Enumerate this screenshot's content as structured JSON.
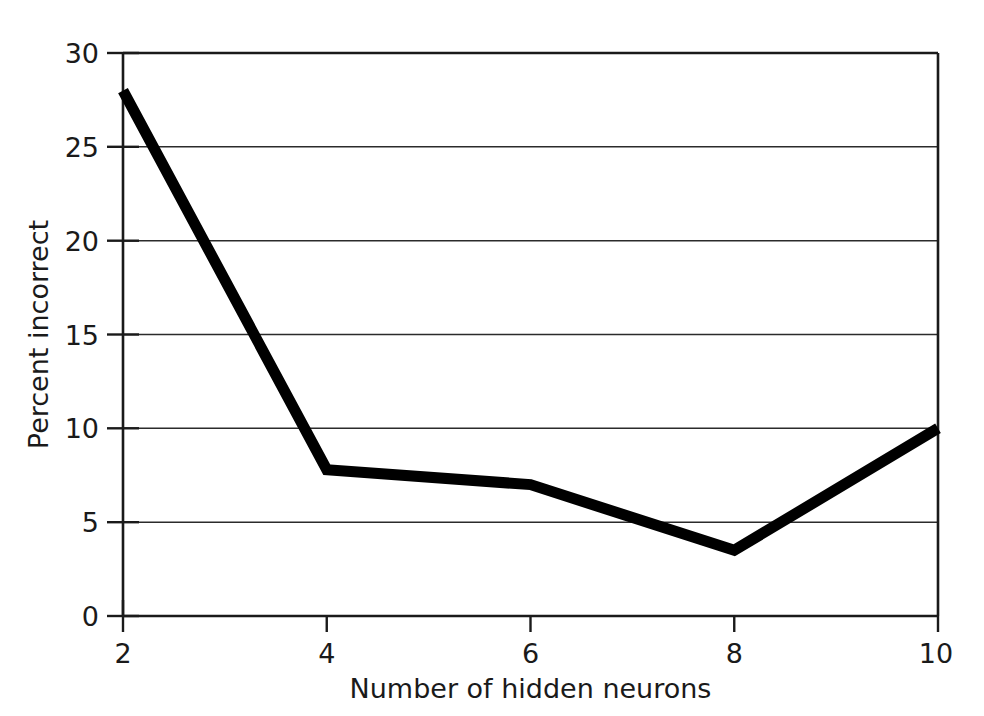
{
  "chart_data": {
    "type": "line",
    "title": "",
    "xlabel": "Number of hidden neurons",
    "ylabel": "Percent incorrect",
    "x": [
      2,
      4,
      6,
      8,
      10
    ],
    "values": [
      28,
      7.8,
      7.0,
      3.5,
      10
    ],
    "series": [
      {
        "name": "Percent incorrect",
        "values": [
          28,
          7.8,
          7.0,
          3.5,
          10
        ]
      }
    ],
    "xlim": [
      2,
      10
    ],
    "ylim": [
      0,
      30
    ],
    "xticks": [
      "2",
      "4",
      "6",
      "8",
      "10"
    ],
    "yticks": [
      "0",
      "5",
      "10",
      "15",
      "20",
      "25",
      "30"
    ],
    "grid": "horizontal",
    "legend": "none",
    "line_color": "#000000",
    "grid_color": "#2b2b2b",
    "axis_color": "#1a1a1a",
    "background_color": "#ffffff"
  },
  "axes": {
    "x_title": "Number of hidden neurons",
    "y_title": "Percent incorrect",
    "x_tick_labels": [
      "2",
      "4",
      "6",
      "8",
      "10"
    ],
    "y_tick_labels": [
      "0",
      "5",
      "10",
      "15",
      "20",
      "25",
      "30"
    ]
  }
}
